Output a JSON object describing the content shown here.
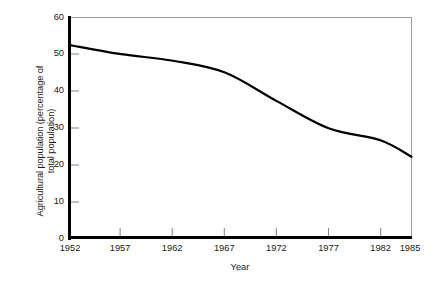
{
  "chart_data": {
    "type": "line",
    "title": "",
    "xlabel": "Year",
    "ylabel": "Agricultural population (percentage of total population)",
    "ylabel_line1": "Agricultural population (percentage of",
    "ylabel_line2": "total population)",
    "x": [
      1952,
      1957,
      1962,
      1967,
      1972,
      1977,
      1982,
      1985
    ],
    "xtick_labels": [
      "1952",
      "1957",
      "1962",
      "1967",
      "1972",
      "1977",
      "1982",
      "1985"
    ],
    "ytick_labels": [
      "0",
      "10",
      "20",
      "30",
      "40",
      "50",
      "60"
    ],
    "ytick_values": [
      0,
      10,
      20,
      30,
      40,
      50,
      60
    ],
    "xlim": [
      1952,
      1985
    ],
    "ylim": [
      0,
      60
    ],
    "grid": false,
    "legend": false,
    "series": [
      {
        "name": "Agricultural population",
        "values": [
          52.5,
          50.0,
          48.2,
          45.0,
          37.2,
          29.8,
          26.5,
          22.0
        ]
      }
    ],
    "line_color": "#000000",
    "line_width": 2.2,
    "axis_color": "#000000",
    "frame_color": "#9a9a9a",
    "background_color": "#ffffff"
  }
}
